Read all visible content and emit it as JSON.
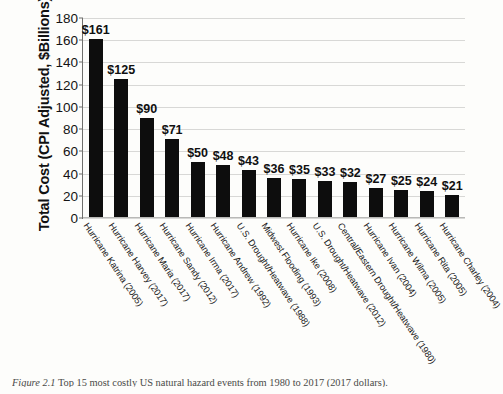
{
  "chart_data": {
    "type": "bar",
    "title": "",
    "xlabel": "",
    "ylabel": "Total Cost (CPI Adjusted, $Billions)",
    "ylim": [
      0,
      180
    ],
    "ytick_step": 20,
    "yticks": [
      180,
      160,
      140,
      120,
      100,
      80,
      60,
      40,
      20,
      0
    ],
    "grid": true,
    "legend": null,
    "bar_color": "#0d0d0d",
    "categories": [
      "Hurricane Katrina (2005)",
      "Hurricane Harvey (2017)",
      "Hurricane Maria (2017)",
      "Hurricane Sandy (2012)",
      "Hurricane Irma (2017)",
      "Hurricane Andrew (1992)",
      "U.S. Drought/Heatwave (1988)",
      "Midwest Flooding (1993)",
      "Hurricane Ike (2008)",
      "U.S. Drought/Heatwave (2012)",
      "Central/Eastern Drought/Heatwave (1980)",
      "Hurricane Ivan (2004)",
      "Hurricane Wilma (2005)",
      "Hurricane Rita (2005)",
      "Hurricane Charley (2004)"
    ],
    "values": [
      161,
      125,
      90,
      71,
      50,
      48,
      43,
      36,
      35,
      33,
      32,
      27,
      25,
      24,
      21
    ],
    "data_labels": [
      "$161",
      "$125",
      "$90",
      "$71",
      "$50",
      "$48",
      "$43",
      "$36",
      "$35",
      "$33",
      "$32",
      "$27",
      "$25",
      "$24",
      "$21"
    ]
  },
  "caption": {
    "label": "Figure 2.1",
    "text": "Top 15 most costly US natural hazard events from 1980 to 2017 (2017 dollars)."
  }
}
